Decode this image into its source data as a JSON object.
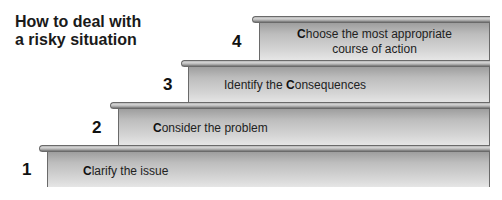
{
  "title": {
    "line1": "How to deal with",
    "line2": "a risky situation"
  },
  "steps": [
    {
      "number": "1",
      "initial": "C",
      "rest": "larify the issue"
    },
    {
      "number": "2",
      "initial": "C",
      "rest": "onsider the problem"
    },
    {
      "number": "3",
      "prefix": "Identify the ",
      "initial": "C",
      "rest": "onsequences"
    },
    {
      "number": "4",
      "initial": "C",
      "rest": "hoose the most appropriate",
      "line2": "course of action"
    }
  ],
  "colors": {
    "step_fill": "#c4c4c4",
    "step_edge": "#6a6a6a",
    "text": "#1a1a1a"
  }
}
